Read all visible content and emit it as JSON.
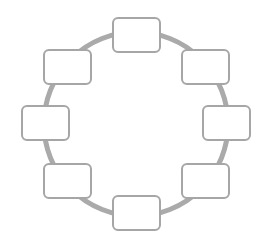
{
  "diagram": {
    "type": "cycle",
    "ring": {
      "cx": 136,
      "cy": 124,
      "r": 92,
      "stroke": "#aaaaaa",
      "stroke_width": 5
    },
    "node_style": {
      "fill": "#ffffff",
      "stroke": "#a6a6a6",
      "stroke_width": 2,
      "rx": 5,
      "width": 47,
      "height": 34
    },
    "nodes": [
      {
        "id": "top",
        "x": 113,
        "y": 18,
        "label": ""
      },
      {
        "id": "top-right",
        "x": 182,
        "y": 50,
        "label": ""
      },
      {
        "id": "right",
        "x": 203,
        "y": 106,
        "label": ""
      },
      {
        "id": "bottom-right",
        "x": 182,
        "y": 164,
        "label": ""
      },
      {
        "id": "bottom",
        "x": 113,
        "y": 196,
        "label": ""
      },
      {
        "id": "bottom-left",
        "x": 44,
        "y": 164,
        "label": ""
      },
      {
        "id": "left",
        "x": 22,
        "y": 106,
        "label": ""
      },
      {
        "id": "top-left",
        "x": 44,
        "y": 50,
        "label": ""
      }
    ]
  }
}
